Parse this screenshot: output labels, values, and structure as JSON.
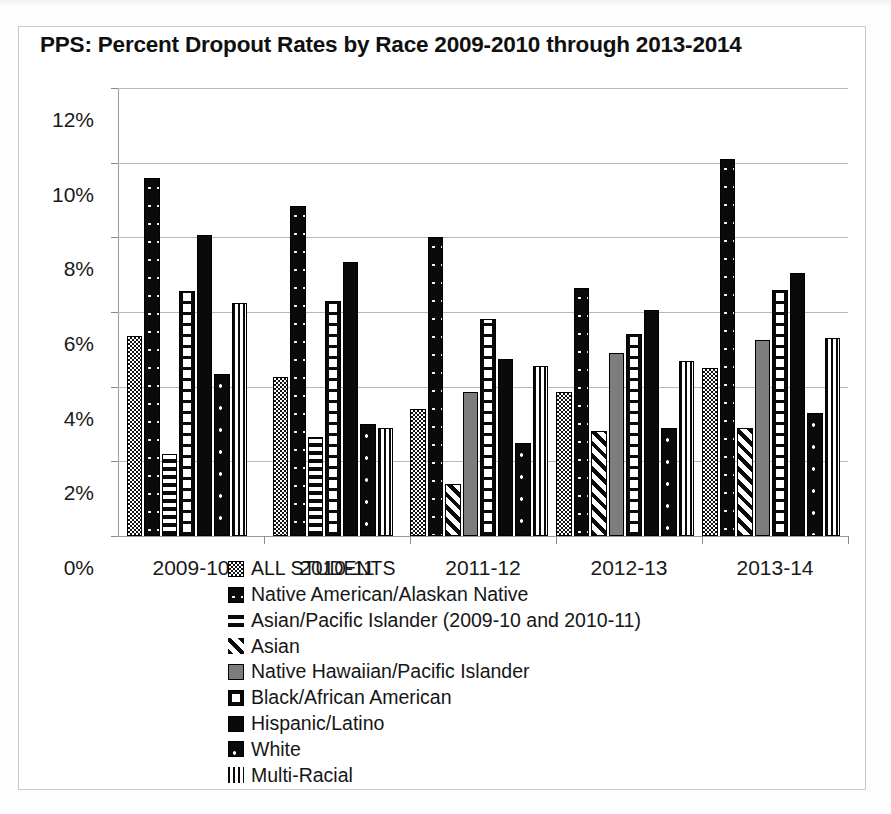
{
  "chart_data": {
    "type": "bar",
    "title": "PPS: Percent Dropout Rates by Race 2009-2010 through 2013-2014",
    "xlabel": "",
    "ylabel": "",
    "ylim": [
      0,
      12
    ],
    "ytick_labels": [
      "0%",
      "2%",
      "4%",
      "6%",
      "8%",
      "10%",
      "12%"
    ],
    "ytick_values": [
      0,
      2,
      4,
      6,
      8,
      10,
      12
    ],
    "grid": true,
    "legend_position": "bottom",
    "categories": [
      "2009-10",
      "2010-11",
      "2011-12",
      "2012-13",
      "2013-14"
    ],
    "series": [
      {
        "name": "ALL STUDENTS",
        "pattern": "p-all",
        "values": [
          5.35,
          4.25,
          3.4,
          3.85,
          4.5
        ]
      },
      {
        "name": "Native American/Alaskan Native",
        "pattern": "p-native",
        "values": [
          9.6,
          8.85,
          8.0,
          6.65,
          10.1
        ]
      },
      {
        "name": "Asian/Pacific Islander (2009-10 and 2010-11)",
        "pattern": "p-api",
        "values": [
          2.2,
          2.65,
          null,
          null,
          null
        ]
      },
      {
        "name": "Asian",
        "pattern": "p-asian",
        "values": [
          null,
          null,
          1.4,
          2.8,
          2.9
        ]
      },
      {
        "name": "Native Hawaiian/Pacific Islander",
        "pattern": "p-nhpi",
        "values": [
          null,
          null,
          3.85,
          4.9,
          5.25
        ]
      },
      {
        "name": "Black/African American",
        "pattern": "p-black",
        "values": [
          6.55,
          6.3,
          5.8,
          5.4,
          6.6
        ]
      },
      {
        "name": "Hispanic/Latino",
        "pattern": "p-hisp",
        "values": [
          8.05,
          7.35,
          4.75,
          6.05,
          7.05
        ]
      },
      {
        "name": "White",
        "pattern": "p-white",
        "values": [
          4.35,
          3.0,
          2.5,
          2.9,
          3.3
        ]
      },
      {
        "name": "Multi-Racial",
        "pattern": "p-multi",
        "values": [
          6.25,
          2.9,
          4.55,
          4.7,
          5.3
        ]
      }
    ]
  },
  "legend": {
    "items": [
      {
        "label": "ALL STUDENTS",
        "swatch": "p-all"
      },
      {
        "label": "Native American/Alaskan Native",
        "swatch": "p-native"
      },
      {
        "label": "Asian/Pacific Islander (2009-10 and 2010-11)",
        "swatch": "p-api"
      },
      {
        "label": "Asian",
        "swatch": "p-asian"
      },
      {
        "label": "Native Hawaiian/Pacific Islander",
        "swatch": "p-nhpi"
      },
      {
        "label": "Black/African American",
        "swatch": "p-black"
      },
      {
        "label": "Hispanic/Latino",
        "swatch": "p-hisp"
      },
      {
        "label": "White",
        "swatch": "p-white"
      },
      {
        "label": "Multi-Racial",
        "swatch": "p-multi"
      }
    ]
  },
  "colors": {
    "ink": "#0a0a0a",
    "grid": "#b8b8b8",
    "axis": "#9a9a9a",
    "frame": "#c9c9c9",
    "gray_fill": "#7d7d7d",
    "background": "#ffffff"
  }
}
